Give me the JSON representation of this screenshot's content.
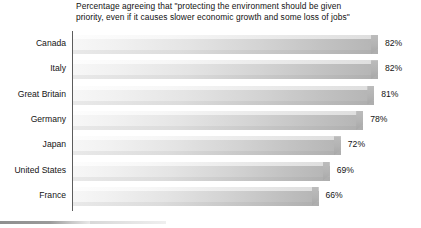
{
  "chart_data": {
    "type": "bar",
    "orientation": "horizontal",
    "title": "Percentage agreeing that \"protecting the environment should be given\npriority, even if it causes slower economic growth and some loss of jobs\"",
    "xlabel": "",
    "ylabel": "",
    "xlim": [
      0,
      100
    ],
    "grid": false,
    "legend": null,
    "categories": [
      "Canada",
      "Italy",
      "Great Britain",
      "Germany",
      "Japan",
      "United States",
      "France"
    ],
    "values": [
      82,
      82,
      81,
      78,
      72,
      69,
      66
    ],
    "value_labels": [
      "82%",
      "82%",
      "81%",
      "78%",
      "72%",
      "69%",
      "66%"
    ],
    "bars": [
      {
        "category": "Canada",
        "value": 82,
        "label": "82%"
      },
      {
        "category": "Italy",
        "value": 82,
        "label": "82%"
      },
      {
        "category": "Great Britain",
        "value": 81,
        "label": "81%"
      },
      {
        "category": "Germany",
        "value": 78,
        "label": "78%"
      },
      {
        "category": "Japan",
        "value": 72,
        "label": "72%"
      },
      {
        "category": "United States",
        "value": 69,
        "label": "69%"
      },
      {
        "category": "France",
        "value": 66,
        "label": "66%"
      }
    ],
    "colors": {
      "bar_gradient_start": "#f7f7f7",
      "bar_gradient_end": "#b4b4b4",
      "axis_line": "#5d5d5d",
      "text": "#141414",
      "background": "#ffffff"
    }
  }
}
